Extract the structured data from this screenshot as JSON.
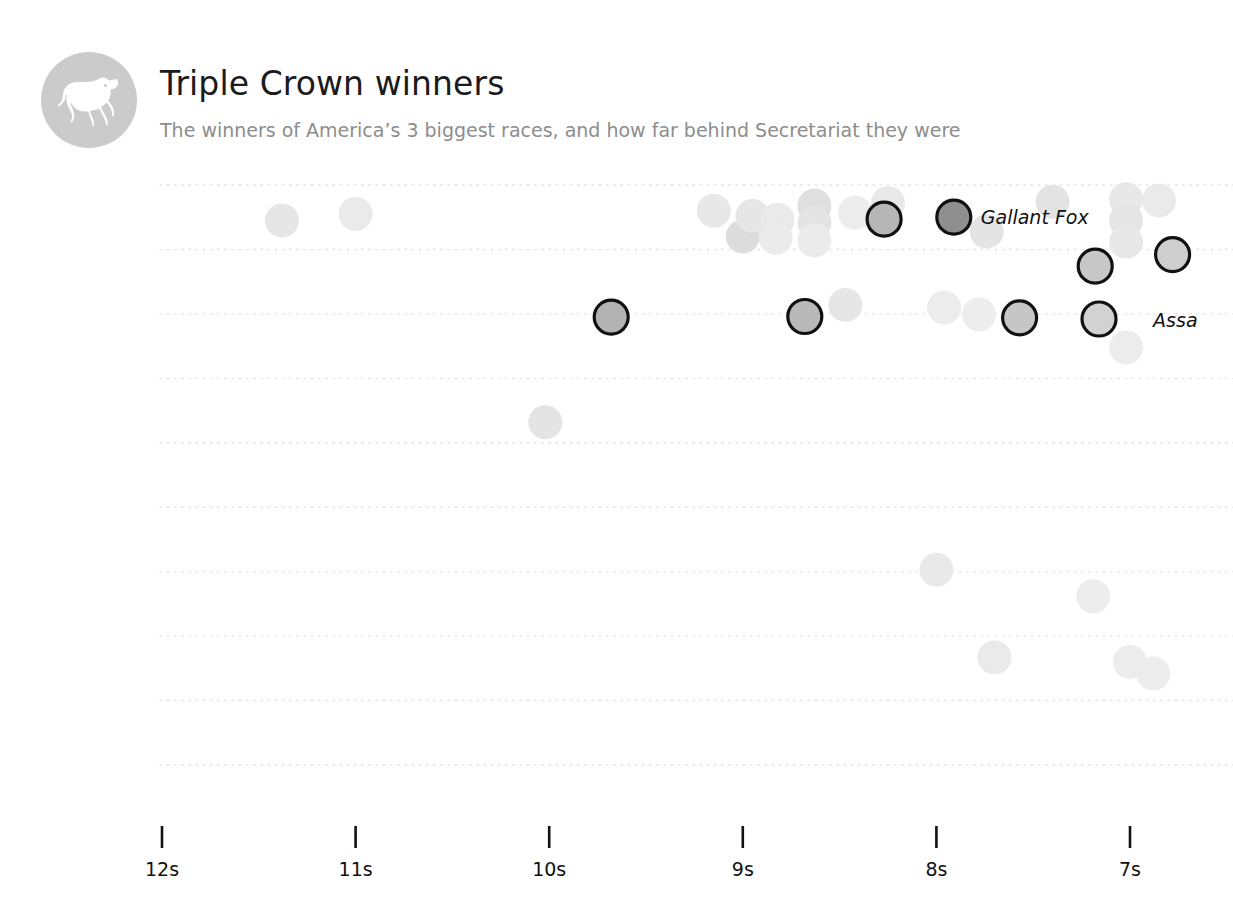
{
  "header": {
    "title": "Triple Crown winners",
    "subtitle": "The winners of America’s 3 biggest races, and how far behind Secretariat they were",
    "logo_icon": "horse-icon",
    "logo_bg": "#cbcbcb",
    "title_color": "#1b1b1b",
    "subtitle_color": "#8d8d8d"
  },
  "chart_data": {
    "type": "scatter",
    "title": "Triple Crown winners",
    "subtitle": "The winners of America’s 3 biggest races, and how far behind Secretariat they were",
    "xlabel": "",
    "ylabel": "",
    "xlim": [
      12.35,
      6.55
    ],
    "x_inverted": true,
    "xticks": [
      12,
      11,
      10,
      9,
      8,
      7
    ],
    "xtick_labels": [
      "12s",
      "11s",
      "10s",
      "9s",
      "8s",
      "7s"
    ],
    "grid": "horizontal-dotted",
    "grid_color": "#e3e3e3",
    "legend": "none",
    "ylim": [
      0,
      10
    ],
    "yticks": [
      0,
      1,
      2,
      3,
      4,
      5,
      6,
      7,
      8,
      9
    ],
    "marker_radius_px": 17,
    "faded_fill": "#eaeaea",
    "highlight_ring": "#111111",
    "annotations": [
      {
        "label": "Gallant Fox",
        "x": 7.91,
        "y": 8.5
      },
      {
        "label": "Assa",
        "x": 7.02,
        "y": 6.9,
        "clipped": true
      }
    ],
    "points": [
      {
        "x": 11.38,
        "y": 8.45,
        "highlight": false,
        "fill": "#e6e6e6"
      },
      {
        "x": 11.0,
        "y": 8.55,
        "highlight": false,
        "fill": "#eaeaea"
      },
      {
        "x": 9.15,
        "y": 8.6,
        "highlight": false,
        "fill": "#e8e8e8"
      },
      {
        "x": 9.0,
        "y": 8.2,
        "highlight": false,
        "fill": "#dcdcdc"
      },
      {
        "x": 8.95,
        "y": 8.52,
        "highlight": false,
        "fill": "#e6e6e6"
      },
      {
        "x": 8.82,
        "y": 8.46,
        "highlight": false,
        "fill": "#eaeaea"
      },
      {
        "x": 8.83,
        "y": 8.18,
        "highlight": false,
        "fill": "#ebebeb"
      },
      {
        "x": 8.63,
        "y": 8.68,
        "highlight": false,
        "fill": "#dfdfdf"
      },
      {
        "x": 8.63,
        "y": 8.42,
        "highlight": false,
        "fill": "#e4e4e4"
      },
      {
        "x": 8.63,
        "y": 8.14,
        "highlight": false,
        "fill": "#ebebeb"
      },
      {
        "x": 8.42,
        "y": 8.57,
        "highlight": false,
        "fill": "#ececec"
      },
      {
        "x": 8.25,
        "y": 8.72,
        "highlight": false,
        "fill": "#e9e9e9"
      },
      {
        "x": 8.27,
        "y": 8.47,
        "highlight": true,
        "fill": "#b6b6b6"
      },
      {
        "x": 7.91,
        "y": 8.5,
        "highlight": true,
        "fill": "#8f8f8f"
      },
      {
        "x": 7.74,
        "y": 8.28,
        "highlight": false,
        "fill": "#e4e4e4"
      },
      {
        "x": 7.4,
        "y": 8.74,
        "highlight": false,
        "fill": "#e3e3e3"
      },
      {
        "x": 7.02,
        "y": 8.78,
        "highlight": false,
        "fill": "#e8e8e8"
      },
      {
        "x": 6.85,
        "y": 8.76,
        "highlight": false,
        "fill": "#eaeaea"
      },
      {
        "x": 7.02,
        "y": 8.45,
        "highlight": false,
        "fill": "#e5e5e5"
      },
      {
        "x": 7.02,
        "y": 8.12,
        "highlight": false,
        "fill": "#e8e8e8"
      },
      {
        "x": 6.78,
        "y": 7.92,
        "highlight": true,
        "fill": "#cfcfcf"
      },
      {
        "x": 7.18,
        "y": 7.74,
        "highlight": true,
        "fill": "#c8c8c8"
      },
      {
        "x": 9.68,
        "y": 6.95,
        "highlight": true,
        "fill": "#b3b3b3"
      },
      {
        "x": 8.68,
        "y": 6.96,
        "highlight": true,
        "fill": "#b9b9b9"
      },
      {
        "x": 8.47,
        "y": 7.14,
        "highlight": false,
        "fill": "#e6e6e6"
      },
      {
        "x": 7.96,
        "y": 7.1,
        "highlight": false,
        "fill": "#ececec"
      },
      {
        "x": 7.78,
        "y": 6.99,
        "highlight": false,
        "fill": "#ededed"
      },
      {
        "x": 7.57,
        "y": 6.94,
        "highlight": true,
        "fill": "#c6c6c6"
      },
      {
        "x": 7.16,
        "y": 6.92,
        "highlight": true,
        "fill": "#d2d2d2"
      },
      {
        "x": 7.02,
        "y": 6.48,
        "highlight": false,
        "fill": "#ececec"
      },
      {
        "x": 10.02,
        "y": 5.32,
        "highlight": false,
        "fill": "#e4e4e4"
      },
      {
        "x": 8.0,
        "y": 3.03,
        "highlight": false,
        "fill": "#e9e9e9"
      },
      {
        "x": 7.19,
        "y": 2.62,
        "highlight": false,
        "fill": "#ededed"
      },
      {
        "x": 7.7,
        "y": 1.67,
        "highlight": false,
        "fill": "#eaeaea"
      },
      {
        "x": 7.0,
        "y": 1.6,
        "highlight": false,
        "fill": "#ececec"
      },
      {
        "x": 6.88,
        "y": 1.42,
        "highlight": false,
        "fill": "#ededed"
      }
    ]
  },
  "axis": {
    "tick_color": "#111111",
    "label_color": "#111111"
  }
}
